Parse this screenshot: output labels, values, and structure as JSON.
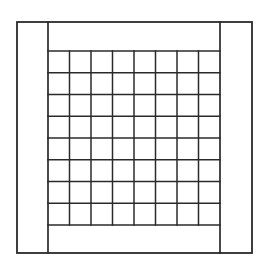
{
  "diagram": {
    "type": "framed-grid",
    "stroke_color": "#2a2a2a",
    "background": "#ffffff",
    "outer_frame": {
      "x1": 17,
      "y1": 22,
      "x2": 252,
      "y2": 253
    },
    "inner_frame": {
      "x1": 48,
      "y1": 22,
      "x2": 220,
      "y2": 253
    },
    "grid": {
      "rows": 8,
      "cols": 8,
      "x1": 48,
      "y1": 51,
      "x2": 220,
      "y2": 225
    }
  }
}
